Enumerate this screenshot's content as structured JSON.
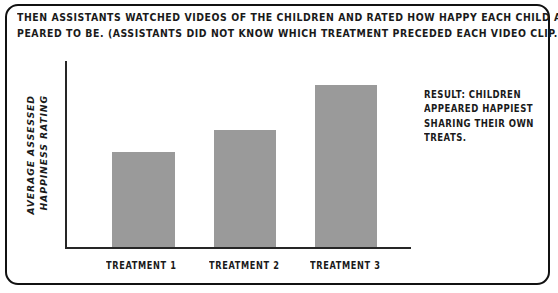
{
  "panel": {
    "border_color": "#111111",
    "background": "#ffffff"
  },
  "header": {
    "lines": [
      "THEN ASSISTANTS WATCHED VIDEOS OF THE CHILDREN AND RATED HOW HAPPY EACH CHILD AP-",
      "PEARED TO BE. (ASSISTANTS DID NOT KNOW WHICH TREATMENT PRECEDED EACH VIDEO CLIP.)"
    ]
  },
  "result": {
    "lines": [
      "RESULT: CHILDREN",
      "APPEARED HAPPIEST",
      "SHARING THEIR OWN",
      "TREATS."
    ]
  },
  "chart_data": {
    "type": "bar",
    "title": "",
    "xlabel": "",
    "ylabel_lines": [
      "AVERAGE ASSESSED",
      "HAPPINESS RATING"
    ],
    "ylabel": "AVERAGE ASSESSED HAPPINESS RATING",
    "categories": [
      "TREATMENT 1",
      "TREATMENT 2",
      "TREATMENT 3"
    ],
    "values": [
      51,
      63,
      87
    ],
    "ylim": [
      0,
      100
    ],
    "grid": false,
    "legend": false,
    "bar_color": "#9a9a9a",
    "axis_color": "#262626"
  }
}
